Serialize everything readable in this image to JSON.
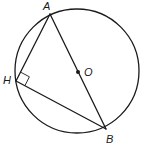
{
  "diagram": {
    "circle": {
      "center_label": "O",
      "cx": 77,
      "cy": 71,
      "r": 62
    },
    "points": [
      {
        "id": "A",
        "label": "A",
        "x": 50,
        "y": 14,
        "label_x": 43,
        "label_y": 10
      },
      {
        "id": "B",
        "label": "B",
        "x": 106,
        "y": 129,
        "label_x": 106,
        "label_y": 143
      },
      {
        "id": "H",
        "label": "H",
        "x": 16,
        "y": 81,
        "label_x": 3,
        "label_y": 84
      },
      {
        "id": "O",
        "label": "O",
        "x": 78,
        "y": 72,
        "label_x": 84,
        "label_y": 76
      }
    ],
    "segments": [
      {
        "from": "A",
        "to": "B",
        "name": "diameter-AB"
      },
      {
        "from": "A",
        "to": "H",
        "name": "chord-AH"
      },
      {
        "from": "H",
        "to": "B",
        "name": "chord-HB"
      }
    ],
    "right_angle_at": "H"
  }
}
